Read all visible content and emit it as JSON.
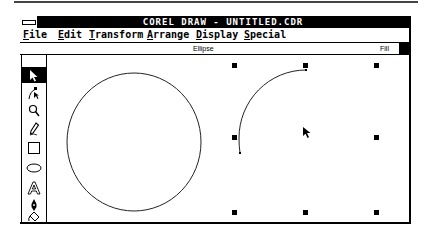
{
  "window": {
    "title": "COREL DRAW - UNTITLED.CDR"
  },
  "menubar": {
    "items": [
      {
        "label": "File",
        "mnemonic": "F",
        "rest": "ile"
      },
      {
        "label": "Edit",
        "mnemonic": "E",
        "rest": "dit"
      },
      {
        "label": "Transform",
        "mnemonic": "T",
        "rest": "ransform"
      },
      {
        "label": "Arrange",
        "mnemonic": "A",
        "rest": "rrange"
      },
      {
        "label": "Display",
        "mnemonic": "D",
        "rest": "isplay"
      },
      {
        "label": "Special",
        "mnemonic": "S",
        "rest": "pecial"
      }
    ]
  },
  "statusbar": {
    "object_type": "Ellipse",
    "fill_label": "Fill",
    "fill_color": "#000000"
  },
  "toolbox": {
    "tools": [
      {
        "name": "pick-tool",
        "icon": "arrow-pointer",
        "selected": true
      },
      {
        "name": "shape-tool",
        "icon": "node-edit"
      },
      {
        "name": "zoom-tool",
        "icon": "magnifier"
      },
      {
        "name": "pencil-tool",
        "icon": "pencil"
      },
      {
        "name": "rectangle-tool",
        "icon": "rectangle"
      },
      {
        "name": "ellipse-tool",
        "icon": "ellipse"
      },
      {
        "name": "text-tool",
        "icon": "letter-A"
      },
      {
        "name": "outline-tool",
        "icon": "pen-nib"
      },
      {
        "name": "fill-tool",
        "icon": "paint-bucket"
      }
    ]
  },
  "canvas": {
    "objects": [
      {
        "type": "circle",
        "cx": 134,
        "cy": 142,
        "rx": 67,
        "ry": 69
      },
      {
        "type": "arc",
        "selected": true,
        "start": [
          306,
          70
        ],
        "end": [
          240,
          153
        ]
      }
    ],
    "selection_handles": [
      [
        234,
        65
      ],
      [
        305,
        65
      ],
      [
        376,
        65
      ],
      [
        234,
        137
      ],
      [
        376,
        137
      ],
      [
        234,
        212
      ],
      [
        305,
        212
      ],
      [
        376,
        212
      ]
    ],
    "mouse_cursor": [
      303,
      128
    ]
  }
}
